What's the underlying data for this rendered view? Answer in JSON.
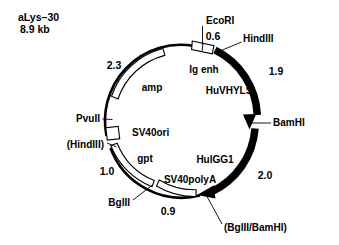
{
  "diagram": {
    "kind": "plasmid-map",
    "title_line1": "aLys–30",
    "title_line2": "8.9 kb",
    "circle": {
      "cx": 182,
      "cy": 121,
      "r": 76
    }
  },
  "restriction_sites": [
    {
      "id": "ecori",
      "label": "EcoRI",
      "x": 206,
      "y": 21,
      "anchor": "start"
    },
    {
      "id": "hindiii",
      "label": "HindIII",
      "x": 243,
      "y": 39,
      "anchor": "start"
    },
    {
      "id": "bamhi",
      "label": "BamHI",
      "x": 273,
      "y": 123,
      "anchor": "start"
    },
    {
      "id": "bglii_bamhi",
      "label": "(BglII/BamHI)",
      "x": 224,
      "y": 228,
      "anchor": "start"
    },
    {
      "id": "bglii",
      "label": "BglII",
      "x": 130,
      "y": 203,
      "anchor": "end"
    },
    {
      "id": "hindiii_paren",
      "label": "(HindIII)",
      "x": 104,
      "y": 145,
      "anchor": "end"
    },
    {
      "id": "pvuii",
      "label": "PvuII",
      "x": 100,
      "y": 119,
      "anchor": "end"
    }
  ],
  "segment_labels": [
    {
      "id": "ig-enh",
      "label": "Ig enh",
      "x": 204,
      "y": 70,
      "anchor": "middle"
    },
    {
      "id": "huvhyls",
      "label": "HuVHYLS",
      "x": 229,
      "y": 91,
      "anchor": "middle"
    },
    {
      "id": "hulgg1",
      "label": "HulGG1",
      "x": 215,
      "y": 160,
      "anchor": "middle"
    },
    {
      "id": "sv40polya",
      "label": "SV40polyA",
      "x": 190,
      "y": 180,
      "anchor": "middle"
    },
    {
      "id": "gpt",
      "label": "gpt",
      "x": 145,
      "y": 159,
      "anchor": "middle"
    },
    {
      "id": "sv40ori",
      "label": "SV40ori",
      "x": 132,
      "y": 133,
      "anchor": "start"
    },
    {
      "id": "amp",
      "label": "amp",
      "x": 152,
      "y": 88,
      "anchor": "middle"
    }
  ],
  "size_labels": [
    {
      "id": "size-0-6",
      "label": "0.6",
      "x": 213,
      "y": 37,
      "anchor": "middle"
    },
    {
      "id": "size-1-9",
      "label": "1.9",
      "x": 276,
      "y": 72,
      "anchor": "middle"
    },
    {
      "id": "size-2-0",
      "label": "2.0",
      "x": 265,
      "y": 176,
      "anchor": "middle"
    },
    {
      "id": "size-0-9",
      "label": "0.9",
      "x": 168,
      "y": 212,
      "anchor": "middle"
    },
    {
      "id": "size-1-0",
      "label": "1.0",
      "x": 107,
      "y": 172,
      "anchor": "middle"
    },
    {
      "id": "size-2-3",
      "label": "2.3",
      "x": 114,
      "y": 66,
      "anchor": "middle"
    }
  ],
  "colors": {
    "ink": "#000000",
    "paper": "#ffffff"
  }
}
